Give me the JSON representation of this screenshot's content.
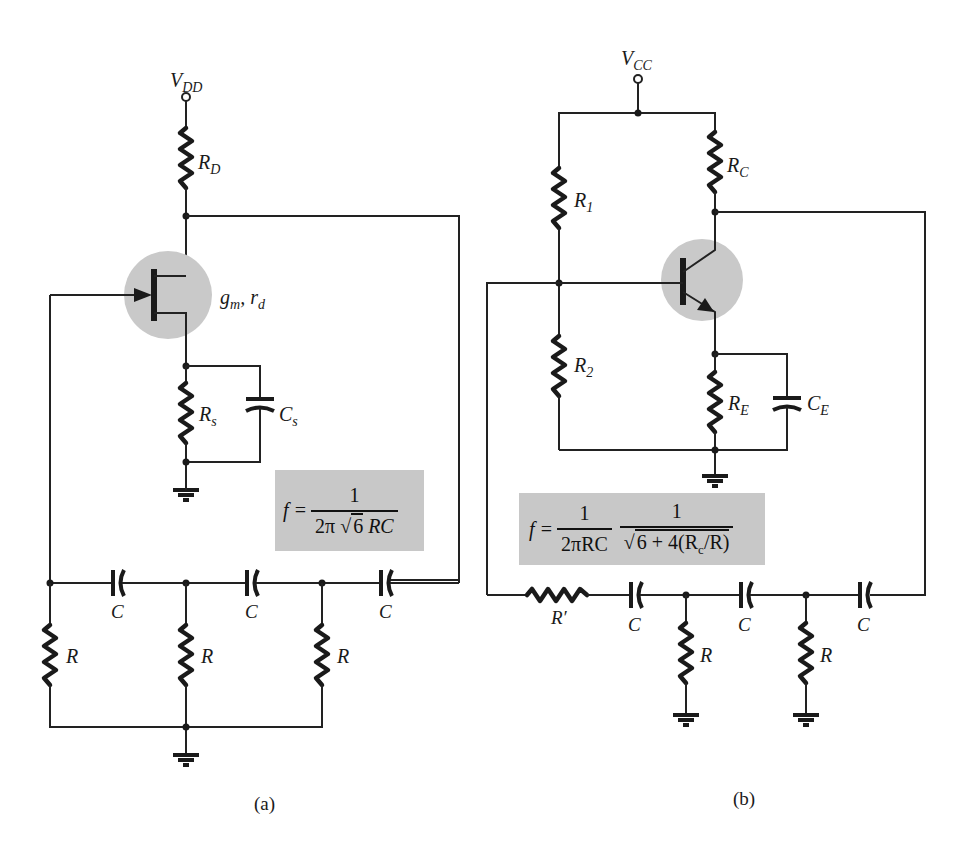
{
  "figure": {
    "panels": [
      {
        "id": "a",
        "caption": "(a)",
        "supply_label": "V",
        "supply_sub": "DD",
        "device": "FET",
        "device_params_label": "g",
        "device_params_sub1": "m",
        "device_params_mid": ", r",
        "device_params_sub2": "d",
        "components": {
          "RD": {
            "main": "R",
            "sub": "D"
          },
          "Rs": {
            "main": "R",
            "sub": "s"
          },
          "Cs": {
            "main": "C",
            "sub": "s"
          },
          "ladder_caps": [
            "C",
            "C",
            "C"
          ],
          "ladder_res": [
            "R",
            "R",
            "R"
          ]
        },
        "formula": {
          "lhs": "f =",
          "numerator": "1",
          "den_prefix": "2π ",
          "den_sqrt": "6",
          "den_suffix": " RC"
        }
      },
      {
        "id": "b",
        "caption": "(b)",
        "supply_label": "V",
        "supply_sub": "CC",
        "device": "BJT",
        "components": {
          "R1": {
            "main": "R",
            "sub": "1"
          },
          "R2": {
            "main": "R",
            "sub": "2"
          },
          "RC": {
            "main": "R",
            "sub": "C"
          },
          "RE": {
            "main": "R",
            "sub": "E"
          },
          "CE": {
            "main": "C",
            "sub": "E"
          },
          "Rprime": "R′",
          "ladder_caps": [
            "C",
            "C",
            "C"
          ],
          "ladder_res": [
            "R",
            "R"
          ]
        },
        "formula": {
          "lhs": "f =",
          "num1": "1",
          "den1": "2πRC",
          "num2": "1",
          "den2_sqrt_a": "6 + 4(R",
          "den2_sub": "c",
          "den2_sqrt_b": "/R)"
        }
      }
    ],
    "colors": {
      "wire": "#222222",
      "device_halo": "#c9c9c9",
      "formula_box": "#c8c8c8",
      "background": "#ffffff"
    }
  }
}
